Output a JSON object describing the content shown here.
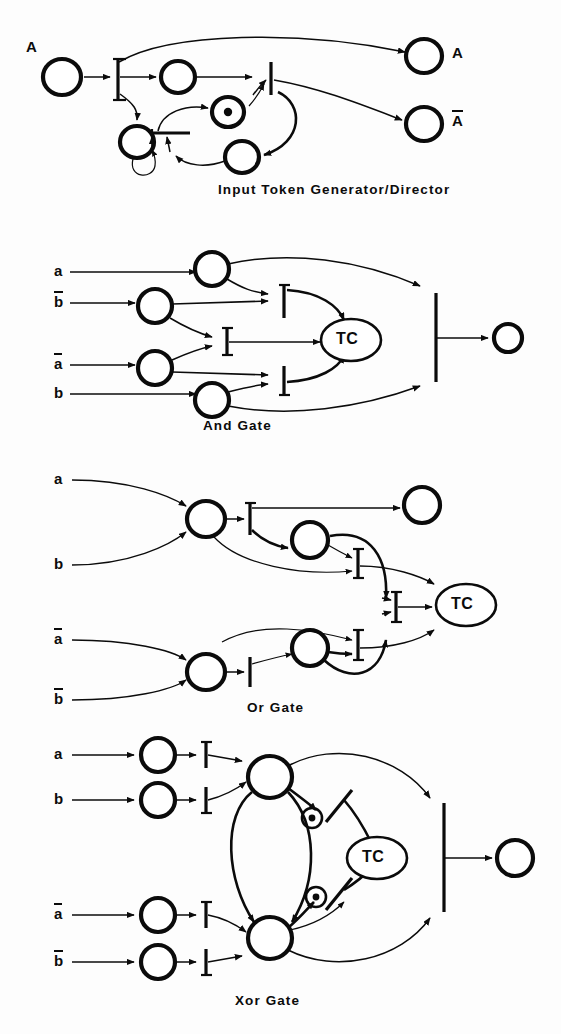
{
  "figure": {
    "kind": "petri-net-diagram-sheet",
    "ink_color": "#0b0b0b",
    "background": "#fdfdfd",
    "panels": [
      {
        "id": "input-token-generator",
        "caption": "Input Token Generator/Director",
        "input_labels": [
          "A"
        ],
        "output_labels": [
          "A",
          "Ā"
        ],
        "marked_places": 1,
        "notes": "single input place A fans out through a transition into a loop of places and transitions, producing outputs A and A-bar"
      },
      {
        "id": "and-gate",
        "caption": "And Gate",
        "input_labels": [
          "a",
          "b̄",
          "ā",
          "b"
        ],
        "output_labels": [],
        "internal_nodes": [
          "TC"
        ],
        "output_place_marked": true
      },
      {
        "id": "or-gate",
        "caption": "Or Gate",
        "input_labels": [
          "a",
          "b",
          "ā",
          "b̄"
        ],
        "output_labels": [],
        "internal_nodes": [
          "TC"
        ],
        "output_place_marked": false
      },
      {
        "id": "xor-gate",
        "caption": "Xor Gate",
        "input_labels": [
          "a",
          "b",
          "ā",
          "b̄"
        ],
        "output_labels": [],
        "internal_nodes": [
          "TC"
        ],
        "output_place_marked": false
      }
    ],
    "token_place_label": "o",
    "tc_label": "TC"
  },
  "captions": {
    "panel1": "Input Token Generator/Director",
    "panel2": "And Gate",
    "panel3": "Or Gate",
    "panel4": "Xor Gate"
  },
  "labels": {
    "A": "A",
    "a": "a",
    "b": "b",
    "tc": "TC",
    "token_dot": "o"
  }
}
